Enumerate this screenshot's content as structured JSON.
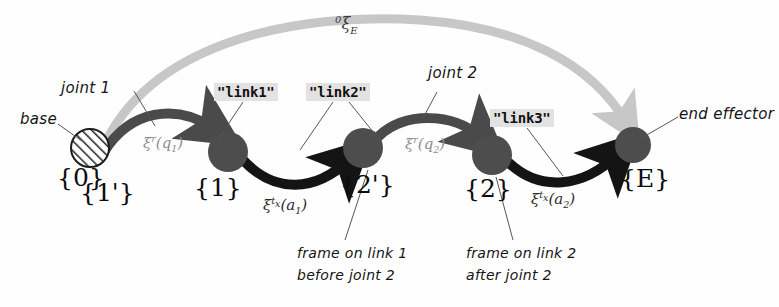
{
  "figure": {
    "background": "#fefefe"
  },
  "colors": {
    "dark_arrow": "#141414",
    "mid_arrow": "#4a4a4a",
    "light_arrow": "#c7c7c7",
    "node_fill": "#4d4d4d",
    "leader_line": "#555555",
    "code_bg": "#e2e2e2",
    "text": "#111111"
  },
  "nodes": [
    {
      "id": "base",
      "name": "base-joint-node",
      "label": "{0}",
      "label2": "{1'}",
      "x": 90,
      "y": 148,
      "r": 19,
      "style": "hatched"
    },
    {
      "id": "n1",
      "name": "frame-1-node",
      "label": "{1}",
      "x": 228,
      "y": 152,
      "r": 20,
      "style": "solid"
    },
    {
      "id": "n2p",
      "name": "frame-2-prime-node",
      "label": "{2'}",
      "x": 363,
      "y": 148,
      "r": 20,
      "style": "solid"
    },
    {
      "id": "n2",
      "name": "frame-2-node",
      "label": "{2}",
      "x": 492,
      "y": 155,
      "r": 20,
      "style": "solid"
    },
    {
      "id": "nE",
      "name": "end-effector-node",
      "label": "{E}",
      "x": 633,
      "y": 145,
      "r": 18,
      "style": "solid"
    }
  ],
  "edges": [
    {
      "name": "rotation-joint-1-edge",
      "label": "ξʳ(q₁)",
      "xi": "ξ",
      "sup": "r",
      "arg": "(q₁)",
      "color": "mid_arrow"
    },
    {
      "name": "translation-link-1-edge",
      "label": "ξᵗˣ(a₁)",
      "xi": "ξ",
      "sup": "t",
      "supsub": "x",
      "arg": "(a₁)",
      "color": "dark_arrow"
    },
    {
      "name": "rotation-joint-2-edge",
      "label": "ξʳ(q₂)",
      "xi": "ξ",
      "sup": "r",
      "arg": "(q₂)",
      "color": "mid_arrow"
    },
    {
      "name": "translation-link-2-edge",
      "label": "ξᵗˣ(a₂)",
      "xi": "ξ",
      "sup": "t",
      "supsub": "x",
      "arg": "(a₂)",
      "color": "dark_arrow"
    },
    {
      "name": "overall-pose-edge",
      "label": "⁰ξ_E",
      "xi": "ξ",
      "presup": "0",
      "sub": "E",
      "color": "light_arrow"
    }
  ],
  "annotations": {
    "base": "base",
    "joint_1": "joint 1",
    "joint_2": "joint 2",
    "end_effector": "end effector",
    "frame_link1_line1": "frame on link 1",
    "frame_link1_line2": "before joint 2",
    "frame_link2_line1": "frame on link 2",
    "frame_link2_line2": "after joint 2"
  },
  "code_labels": {
    "link1": "\"link1\"",
    "link2": "\"link2\"",
    "link3": "\"link3\""
  },
  "frame_labels": {
    "base_0": "{0}",
    "base_1p": "{1'}",
    "f1": "{1}",
    "f2p": "{2'}",
    "f2": "{2}",
    "fE": "{E}"
  },
  "xi_symbols": {
    "rot1_xi": "ξ",
    "rot1_sup": "r",
    "rot1_arg": "(q",
    "rot1_sub": "1",
    "rot1_close": ")",
    "trans1_xi": "ξ",
    "trans1_sup": "t",
    "trans1_supsub": "x",
    "trans1_arg": "(a",
    "trans1_sub": "1",
    "trans1_close": ")",
    "rot2_xi": "ξ",
    "rot2_sup": "r",
    "rot2_arg": "(q",
    "rot2_sub": "2",
    "rot2_close": ")",
    "trans2_xi": "ξ",
    "trans2_sup": "t",
    "trans2_supsub": "x",
    "trans2_arg": "(a",
    "trans2_sub": "2",
    "trans2_close": ")",
    "overall_presup": "0",
    "overall_xi": "ξ",
    "overall_sub": "E"
  }
}
